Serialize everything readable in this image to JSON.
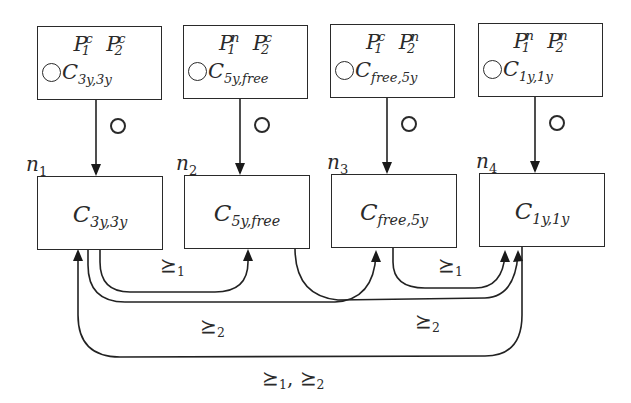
{
  "diagram": {
    "type": "state transition diagram",
    "next_operator_symbol": "next-circle",
    "relations": {
      "r1": {
        "sym": "⪰",
        "idx": "1"
      },
      "r2": {
        "sym": "⪰",
        "idx": "2"
      }
    },
    "top_boxes": [
      {
        "p1": "P",
        "p1_sub": "1",
        "p1_sup": "c",
        "p2": "P",
        "p2_sub": "2",
        "p2_sup": "c",
        "c": "C",
        "c_sub": "3y,3y"
      },
      {
        "p1": "P",
        "p1_sub": "1",
        "p1_sup": "n",
        "p2": "P",
        "p2_sub": "2",
        "p2_sup": "c",
        "c": "C",
        "c_sub": "5y,free"
      },
      {
        "p1": "P",
        "p1_sub": "1",
        "p1_sup": "c",
        "p2": "P",
        "p2_sub": "2",
        "p2_sup": "n",
        "c": "C",
        "c_sub": "free,5y"
      },
      {
        "p1": "P",
        "p1_sub": "1",
        "p1_sup": "n",
        "p2": "P",
        "p2_sub": "2",
        "p2_sup": "n",
        "c": "C",
        "c_sub": "1y,1y"
      }
    ],
    "nodes": [
      {
        "name": "n",
        "name_sub": "1",
        "label": "C",
        "label_sub": "3y,3y"
      },
      {
        "name": "n",
        "name_sub": "2",
        "label": "C",
        "label_sub": "5y,free"
      },
      {
        "name": "n",
        "name_sub": "3",
        "label": "C",
        "label_sub": "free,5y"
      },
      {
        "name": "n",
        "name_sub": "4",
        "label": "C",
        "label_sub": "1y,1y"
      }
    ],
    "edges": [
      {
        "from": "top-box-1",
        "to": "n1",
        "label": "next"
      },
      {
        "from": "top-box-2",
        "to": "n2",
        "label": "next"
      },
      {
        "from": "top-box-3",
        "to": "n3",
        "label": "next"
      },
      {
        "from": "top-box-4",
        "to": "n4",
        "label": "next"
      },
      {
        "from": "n1",
        "to": "n2",
        "label": "⪰1"
      },
      {
        "from": "n1",
        "to": "n3",
        "label": "⪰2"
      },
      {
        "from": "n3",
        "to": "n4",
        "label": "⪰1"
      },
      {
        "from": "n2",
        "to": "n4",
        "label": "⪰2"
      },
      {
        "from": "n4",
        "to": "n1",
        "label": "⪰1, ⪰2"
      }
    ],
    "edge_labels": {
      "n1_n2": {
        "a": "⪰",
        "a_sub": "1"
      },
      "n1_n3": {
        "a": "⪰",
        "a_sub": "2"
      },
      "n3_n4": {
        "a": "⪰",
        "a_sub": "1"
      },
      "n2_n4": {
        "a": "⪰",
        "a_sub": "2"
      },
      "n4_n1": {
        "a": "⪰",
        "a_sub": "1",
        "sep": ", ",
        "b": "⪰",
        "b_sub": "2"
      }
    }
  }
}
